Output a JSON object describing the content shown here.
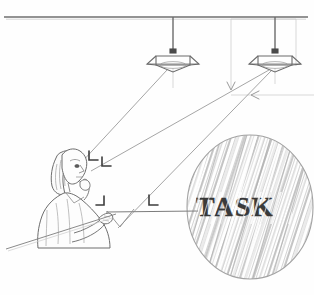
{
  "figure": {
    "title": "TASK",
    "type": "technical-line-drawing",
    "ink_color": "#7a7a7a",
    "dark_ink_color": "#3a3a3a",
    "paper_color": "#fefefe",
    "hatch_color": "#b9b9b9"
  },
  "labels": {
    "task_word": "TASK"
  },
  "ceiling": {
    "name": "ceiling-line",
    "y": 17,
    "x_start": 4,
    "x_end": 308
  },
  "luminaires": [
    {
      "name": "ceiling-lamp-left",
      "stem_x": 173,
      "stem_top": 17,
      "stem_bottom": 51,
      "shade_cx": 173,
      "shade_cy": 62,
      "shade_half_width": 17,
      "shade_half_height": 9
    },
    {
      "name": "ceiling-lamp-right",
      "stem_x": 275,
      "stem_top": 17,
      "stem_bottom": 51,
      "shade_cx": 275,
      "shade_cy": 62,
      "shade_half_width": 17,
      "shade_half_height": 9
    }
  ],
  "task_circle": {
    "name": "task-magnifier-circle",
    "cx": 250,
    "cy": 207,
    "rx": 63,
    "ry": 72,
    "hatching": "diagonal",
    "hatch_angle_deg": -72
  },
  "person": {
    "name": "seated-person",
    "eye_x": 75,
    "eye_y": 167,
    "hand_x": 104,
    "hand_y": 213
  },
  "desk": {
    "name": "desk-line",
    "x_start": 6,
    "y_start": 249,
    "x_end": 115,
    "y_end": 215
  },
  "ray_arrows": [
    {
      "name": "arrow-to-eye-upper",
      "glyph": "L"
    },
    {
      "name": "arrow-to-eye-lower",
      "glyph": "L"
    },
    {
      "name": "arrow-at-hand",
      "glyph": "F"
    },
    {
      "name": "arrow-mid-ray",
      "glyph": "L"
    },
    {
      "name": "arrow-down-v",
      "glyph": "V"
    },
    {
      "name": "arrow-left-pointer",
      "glyph": "<"
    }
  ],
  "guide_lines": [
    {
      "name": "guide-vertical-right",
      "x": 231,
      "y_top": 19,
      "y_bottom": 90
    },
    {
      "name": "guide-horizontal-right",
      "x_start": 231,
      "y": 95,
      "x_end": 314
    },
    {
      "name": "guide-vertical-far-right",
      "x": 296,
      "y_top": 19,
      "y_bottom": 64
    }
  ]
}
